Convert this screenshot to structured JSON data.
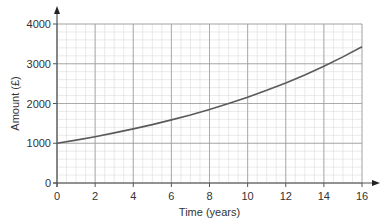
{
  "chart_data": {
    "type": "line",
    "title": "",
    "xlabel": "Time (years)",
    "ylabel": "Amount (£)",
    "xlim": [
      0,
      16
    ],
    "ylim": [
      0,
      4000
    ],
    "x_ticks": [
      0,
      2,
      4,
      6,
      8,
      10,
      12,
      14,
      16
    ],
    "y_ticks": [
      0,
      1000,
      2000,
      3000,
      4000
    ],
    "grid": {
      "major": true,
      "minor": true,
      "minor_x_step": 0.5,
      "minor_y_step": 200
    },
    "legend": null,
    "series": [
      {
        "name": "Amount",
        "x": [
          0,
          1,
          2,
          3,
          4,
          5,
          6,
          7,
          8,
          9,
          10,
          11,
          12,
          13,
          14,
          15,
          16
        ],
        "values": [
          1000,
          1080,
          1166,
          1260,
          1360,
          1469,
          1587,
          1714,
          1851,
          1999,
          2159,
          2332,
          2518,
          2720,
          2937,
          3172,
          3426
        ]
      }
    ]
  },
  "colors": {
    "axis": "#555555",
    "major_grid": "#9a9a9a",
    "minor_grid": "#dcdcdc",
    "curve": "#5a5a5a"
  }
}
